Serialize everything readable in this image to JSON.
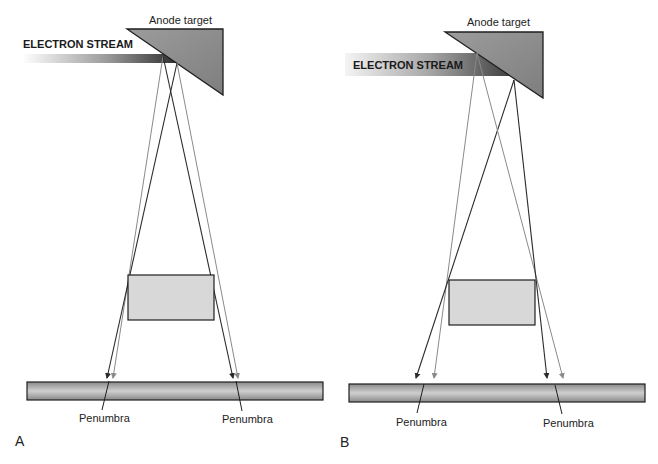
{
  "figure": {
    "panels": [
      {
        "id": "A",
        "panel_label": "A",
        "anode_label": "Anode target",
        "electron_stream_label": "ELECTRON STREAM",
        "penumbra_left_label": "Penumbra",
        "penumbra_right_label": "Penumbra",
        "description": "Small effective focal spot (steep anode angle, narrow electron stream) producing small penumbra"
      },
      {
        "id": "B",
        "panel_label": "B",
        "anode_label": "Anode target",
        "electron_stream_label": "ELECTRON STREAM",
        "penumbra_left_label": "Penumbra",
        "penumbra_right_label": "Penumbra",
        "description": "Larger effective focal spot (wide electron stream) producing larger penumbra"
      }
    ],
    "colors": {
      "anode_fill": "#8f8f8f",
      "object_fill": "#d6d6d6",
      "detector_fill": "#a8a8a8",
      "dark_ray": "#2b2b2b",
      "light_ray": "#8a8a8a",
      "outline": "#1e1e1e"
    }
  }
}
